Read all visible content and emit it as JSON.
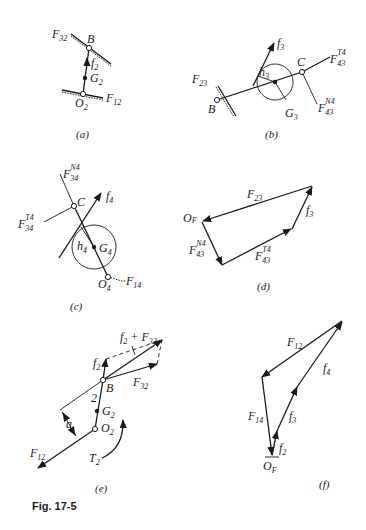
{
  "figure": {
    "caption": "Fig. 17-5",
    "panels": {
      "a": {
        "caption": "(a)",
        "labels": {
          "F32": [
            "F",
            "32"
          ],
          "B": "B",
          "f2": [
            "f",
            "2"
          ],
          "G2": [
            "G",
            "2"
          ],
          "O2": [
            "O",
            "2"
          ],
          "F12": [
            "F",
            "12"
          ]
        }
      },
      "b": {
        "caption": "(b)",
        "labels": {
          "f3": [
            "f",
            "3"
          ],
          "F23": [
            "F",
            "23"
          ],
          "h3": [
            "h",
            "3"
          ],
          "C": "C",
          "F43T4": [
            "F",
            "43",
            "T4"
          ],
          "B": "B",
          "G3": [
            "G",
            "3"
          ],
          "F43N4": [
            "F",
            "43",
            "N4"
          ]
        }
      },
      "c": {
        "caption": "(c)",
        "labels": {
          "F34N4": [
            "F",
            "34",
            "N4"
          ],
          "f4": [
            "f",
            "4"
          ],
          "C": "C",
          "F34T4": [
            "F",
            "34",
            "T4"
          ],
          "h4": [
            "h",
            "4"
          ],
          "G4": [
            "G",
            "4"
          ],
          "O4": [
            "O",
            "4"
          ],
          "F14": [
            "F",
            "14"
          ]
        }
      },
      "d": {
        "caption": "(d)",
        "labels": {
          "F23": [
            "F",
            "23"
          ],
          "OF": [
            "O",
            "F"
          ],
          "f3": [
            "f",
            "3"
          ],
          "F43N4": [
            "F",
            "43",
            "N4"
          ],
          "F43T4": [
            "F",
            "43",
            "T4"
          ]
        }
      },
      "e": {
        "caption": "(e)",
        "labels": {
          "sum": [
            "f",
            "2",
            " + F",
            "32"
          ],
          "f2": [
            "f",
            "2"
          ],
          "B": "B",
          "F32": [
            "F",
            "32"
          ],
          "link": "2",
          "a": "a",
          "G2": [
            "G",
            "2"
          ],
          "O2": [
            "O",
            "2"
          ],
          "F12": [
            "F",
            "12"
          ],
          "T2": [
            "T",
            "2"
          ]
        }
      },
      "f": {
        "caption": "(f)",
        "labels": {
          "F12": [
            "F",
            "12"
          ],
          "f4": [
            "f",
            "4"
          ],
          "F14": [
            "F",
            "14"
          ],
          "f3": [
            "f",
            "3"
          ],
          "f2": [
            "f",
            "2"
          ],
          "OF": [
            "O",
            "F"
          ]
        }
      }
    }
  }
}
